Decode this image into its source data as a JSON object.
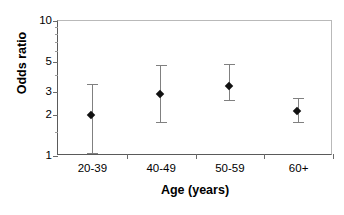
{
  "chart_data": {
    "type": "scatter",
    "title": "",
    "xlabel": "Age (years)",
    "ylabel": "Odds ratio",
    "categories": [
      "20-39",
      "40-49",
      "50-59",
      "60+"
    ],
    "values": [
      2.0,
      2.9,
      3.3,
      2.15
    ],
    "error_low": [
      1.05,
      1.8,
      2.6,
      1.8
    ],
    "error_high": [
      3.4,
      4.7,
      4.8,
      2.7
    ],
    "series": [
      {
        "name": "Odds ratio",
        "values": [
          2.0,
          2.9,
          3.3,
          2.15
        ],
        "ci_low": [
          1.05,
          1.8,
          2.6,
          1.8
        ],
        "ci_high": [
          3.4,
          4.7,
          4.8,
          2.7
        ]
      }
    ],
    "points": [
      {
        "category": "20-39",
        "value": 2.0,
        "ci_low": 1.05,
        "ci_high": 3.4
      },
      {
        "category": "40-49",
        "value": 2.9,
        "ci_low": 1.8,
        "ci_high": 4.7
      },
      {
        "category": "50-59",
        "value": 3.3,
        "ci_low": 2.6,
        "ci_high": 4.8
      },
      {
        "category": "60+",
        "value": 2.15,
        "ci_low": 1.8,
        "ci_high": 2.7
      }
    ],
    "yscale": "log",
    "ylim": [
      1,
      10
    ],
    "ytick_labels": [
      "1",
      "2",
      "3",
      "5",
      "10"
    ],
    "ytick_values": [
      1,
      2,
      3,
      5,
      10
    ],
    "yminor_ticks": [
      1.5,
      4,
      6,
      7,
      8,
      9
    ],
    "grid": false,
    "legend": null,
    "marker": "diamond",
    "marker_color": "#111111",
    "errorbar_color": "#808080",
    "axis_color": "#5a5a5a",
    "background": "#ffffff"
  }
}
